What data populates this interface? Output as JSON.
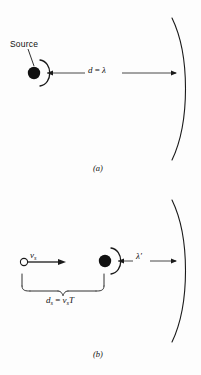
{
  "figure": {
    "background_color": "#fdfdfd",
    "ink_color": "#1a1a1a"
  },
  "panel_a": {
    "tag": "(a)",
    "source_label": "Source",
    "distance_label": {
      "symbol": "d",
      "equals": " = ",
      "value": "λ"
    },
    "elements": {
      "source_dot": "filled-circle",
      "wavefront": "semicircular-arc-right",
      "far_wavefront": "large-arc-right",
      "measure_arrow": "double-headed-arrow"
    }
  },
  "panel_b": {
    "tag": "(b)",
    "velocity_label": {
      "symbol": "v",
      "subscript": "s"
    },
    "displacement_label": {
      "symbol": "d",
      "subscript": "s",
      "equals": " = ",
      "rhs_symbol": "v",
      "rhs_subscript": "s",
      "rhs_period": "T"
    },
    "wavelength_label": "λ′",
    "elements": {
      "start_marker": "open-circle",
      "source_dot": "filled-circle",
      "velocity_arrow": "single-headed-arrow",
      "brace": "curly-brace-under",
      "wavefront": "semicircular-arc-right",
      "far_wavefront": "large-arc-right",
      "measure_arrow": "double-headed-arrow"
    }
  }
}
